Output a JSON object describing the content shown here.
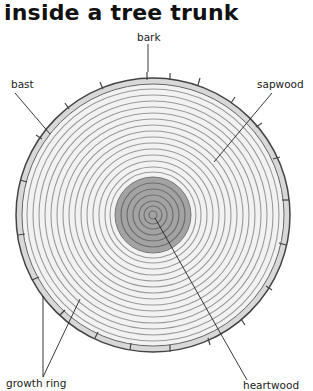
{
  "title": "inside a tree trunk",
  "labels": {
    "bark": "bark",
    "bast": "bast",
    "sapwood": "sapwood",
    "growth_ring": "growth ring",
    "heartwood": "heartwood"
  },
  "colors": {
    "sapwood_fill": "#eeeeee",
    "heartwood_fill": "#9a9a9a",
    "bark_stroke": "#555555",
    "ring_stroke": "#8a8a8a"
  }
}
